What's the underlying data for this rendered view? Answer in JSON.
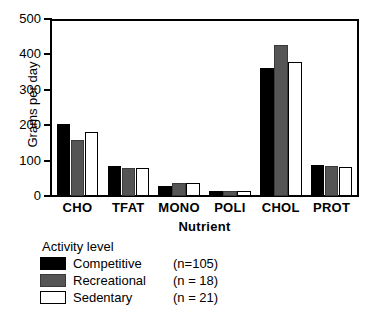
{
  "chart_data": {
    "type": "bar",
    "title": "",
    "xlabel": "Nutrient",
    "ylabel": "Grams per day",
    "categories": [
      "CHO",
      "TFAT",
      "MONO",
      "POLI",
      "CHOL",
      "PROT"
    ],
    "ylim": [
      0,
      500
    ],
    "yticks": [
      0,
      100,
      200,
      300,
      400,
      500
    ],
    "ytick_labels": [
      "0",
      "100",
      "200",
      "300",
      "400",
      "500"
    ],
    "grid": false,
    "legend_position": "below-axes-left",
    "series": [
      {
        "name": "Competitive",
        "n_label": "(n=105)",
        "color": "#000000",
        "values": [
          206,
          85,
          28,
          14,
          367,
          88
        ]
      },
      {
        "name": "Recreational",
        "n_label": "(n = 18)",
        "color": "#555555",
        "values": [
          161,
          79,
          37,
          14,
          432,
          85
        ]
      },
      {
        "name": "Sedentary",
        "n_label": "(n = 21)",
        "color": "#ffffff",
        "values": [
          184,
          79,
          37,
          14,
          384,
          82
        ]
      }
    ]
  },
  "legend": {
    "title": "Activity level"
  },
  "axes": {
    "y_title": "Grams per day",
    "x_title": "Nutrient"
  }
}
